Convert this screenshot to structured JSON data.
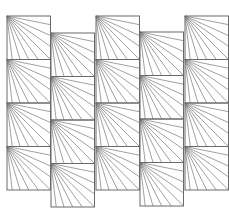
{
  "diagram": {
    "stroke_color": "#6a6a6a",
    "line_color": "#777777",
    "cell_size": 43.5,
    "columns": [
      {
        "x": 7,
        "top": 16,
        "rows": 4
      },
      {
        "x": 51,
        "top": 33,
        "rows": 4
      },
      {
        "x": 96,
        "top": 16,
        "rows": 4
      },
      {
        "x": 140,
        "top": 32,
        "rows": 4
      },
      {
        "x": 185,
        "top": 16,
        "rows": 4
      }
    ],
    "fan": {
      "origin": "top-left",
      "bottom_fractions": [
        0.12,
        0.3,
        0.5,
        0.72,
        1.0
      ],
      "right_fractions": [
        0.2,
        0.45,
        0.7
      ]
    }
  }
}
